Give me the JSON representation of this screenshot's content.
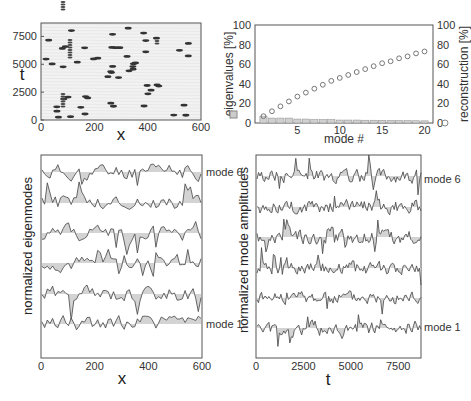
{
  "chart_data": [
    {
      "id": "spacetime",
      "type": "heatmap",
      "title": "",
      "xlabel": "x",
      "ylabel": "t",
      "xlim": [
        0,
        600
      ],
      "ylim": [
        0,
        8700
      ],
      "xticks": [
        "0",
        "200",
        "400",
        "600"
      ],
      "yticks": [
        "0",
        "2500",
        "5000",
        "7500"
      ]
    },
    {
      "id": "spectrum",
      "type": "bar",
      "xlabel": "mode #",
      "ylabel": "eigenvalues [%]",
      "ylabel_right": "reconstruction [%]",
      "xlim": [
        0,
        21
      ],
      "ylim": [
        0,
        100
      ],
      "xticks": [
        "5",
        "10",
        "15",
        "20"
      ],
      "yticks": [
        "0",
        "20",
        "40",
        "60",
        "80",
        "100"
      ],
      "yticks_right": [
        "0",
        "20",
        "40",
        "60",
        "80",
        "100"
      ],
      "categories": [
        1,
        2,
        3,
        4,
        5,
        6,
        7,
        8,
        9,
        10,
        11,
        12,
        13,
        14,
        15,
        16,
        17,
        18,
        19,
        20
      ],
      "series": [
        {
          "name": "eigenvalues [%]",
          "type": "bar",
          "values": [
            7,
            5,
            5,
            5,
            4,
            4,
            3.5,
            3.5,
            3.5,
            3,
            3,
            3,
            2.8,
            2.8,
            2.7,
            2.6,
            2.5,
            2.4,
            2.3,
            2.2
          ]
        },
        {
          "name": "reconstruction [%]",
          "type": "scatter",
          "values": [
            7,
            12,
            17,
            22,
            27,
            31,
            35,
            39,
            43,
            46,
            49,
            52,
            55,
            58,
            61,
            63,
            66,
            68,
            71,
            73
          ]
        }
      ]
    },
    {
      "id": "eigenmodes",
      "type": "line",
      "xlabel": "x",
      "ylabel": "normalized eigenmodes",
      "xlim": [
        0,
        600
      ],
      "xticks": [
        "0",
        "200",
        "400",
        "600"
      ],
      "series_labels": [
        "mode 6",
        "mode 1"
      ],
      "n_series": 6
    },
    {
      "id": "amplitudes",
      "type": "line",
      "xlabel": "t",
      "ylabel": "normalized mode amplitudes",
      "xlim": [
        0,
        8700
      ],
      "xticks": [
        "0",
        "2500",
        "5000",
        "7500"
      ],
      "series_labels": [
        "mode 6",
        "mode 1"
      ],
      "n_series": 6
    }
  ],
  "labels": {
    "p1_x": "x",
    "p1_y": "t",
    "p2_x": "mode #",
    "p2_yl": "eigenvalues [%]",
    "p2_yr": "reconstruction [%]",
    "p3_x": "x",
    "p3_y": "normalized eigenmodes",
    "p3_m6": "mode 6",
    "p3_m1": "mode 1",
    "p4_x": "t",
    "p4_y": "normalized mode amplitudes",
    "p4_m6": "mode 6",
    "p4_m1": "mode 1"
  },
  "ticks": {
    "p1x": [
      "0",
      "200",
      "400",
      "600"
    ],
    "p1y": [
      "0",
      "2500",
      "5000",
      "7500"
    ],
    "p2x": [
      "5",
      "10",
      "15",
      "20"
    ],
    "p2y": [
      "0",
      "20",
      "40",
      "60",
      "80",
      "100"
    ],
    "p3x": [
      "0",
      "200",
      "400",
      "600"
    ],
    "p4x": [
      "0",
      "2500",
      "5000",
      "7500"
    ]
  }
}
